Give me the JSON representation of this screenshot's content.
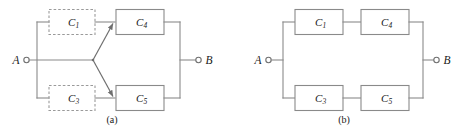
{
  "figure": {
    "kind": "reliability-block-diagram",
    "background_color": "#ffffff",
    "line_color": "#8a8a8a",
    "text_color": "#1a1a1a",
    "panel_count": 2
  },
  "panels": [
    {
      "id": "a",
      "caption": "(a)",
      "description": "Fan-out reliability block diagram with dashed (optional) blocks",
      "terminals": {
        "input": {
          "label": "A",
          "marker": "open-circle"
        },
        "output": {
          "label": "B",
          "marker": "open-circle"
        }
      },
      "blocks": [
        {
          "id": "c1",
          "label": "C",
          "subscript": "1",
          "style": "dashed",
          "position": "top-left"
        },
        {
          "id": "c3",
          "label": "C",
          "subscript": "3",
          "style": "dashed",
          "position": "bottom-left"
        },
        {
          "id": "c4",
          "label": "C",
          "subscript": "4",
          "style": "solid",
          "position": "top-right"
        },
        {
          "id": "c5",
          "label": "C",
          "subscript": "5",
          "style": "solid",
          "position": "bottom-right"
        }
      ],
      "connectors": [
        {
          "from": "A",
          "to": "junction",
          "type": "line"
        },
        {
          "from": "A",
          "to": "c1",
          "type": "line"
        },
        {
          "from": "A",
          "to": "c3",
          "type": "line"
        },
        {
          "from": "c1",
          "to": "c4",
          "type": "line"
        },
        {
          "from": "c3",
          "to": "c5",
          "type": "line"
        },
        {
          "from": "junction",
          "to": "c4",
          "type": "arrow"
        },
        {
          "from": "junction",
          "to": "c5",
          "type": "arrow"
        },
        {
          "from": "c4",
          "to": "B",
          "type": "line"
        },
        {
          "from": "c5",
          "to": "B",
          "type": "line"
        }
      ]
    },
    {
      "id": "b",
      "caption": "(b)",
      "description": "Series-parallel reliability block diagram, all solid blocks",
      "terminals": {
        "input": {
          "label": "A",
          "marker": "open-circle"
        },
        "output": {
          "label": "B",
          "marker": "open-circle"
        }
      },
      "blocks": [
        {
          "id": "c1",
          "label": "C",
          "subscript": "1",
          "style": "solid",
          "position": "top-left"
        },
        {
          "id": "c4",
          "label": "C",
          "subscript": "4",
          "style": "solid",
          "position": "top-right"
        },
        {
          "id": "c3",
          "label": "C",
          "subscript": "3",
          "style": "solid",
          "position": "bottom-left"
        },
        {
          "id": "c5",
          "label": "C",
          "subscript": "5",
          "style": "solid",
          "position": "bottom-right"
        }
      ],
      "connectors": [
        {
          "from": "A",
          "to": "c1",
          "type": "line"
        },
        {
          "from": "A",
          "to": "c3",
          "type": "line"
        },
        {
          "from": "c1",
          "to": "c4",
          "type": "line"
        },
        {
          "from": "c3",
          "to": "c5",
          "type": "line"
        },
        {
          "from": "c4",
          "to": "B",
          "type": "line"
        },
        {
          "from": "c5",
          "to": "B",
          "type": "line"
        }
      ]
    }
  ]
}
